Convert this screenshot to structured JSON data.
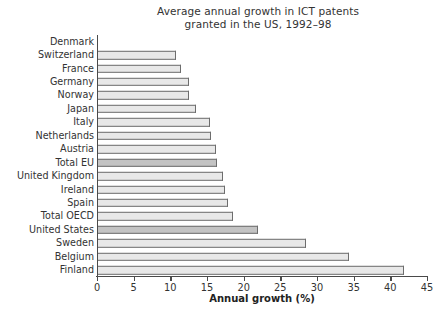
{
  "chart_data": {
    "type": "bar",
    "orientation": "horizontal",
    "title": "Average annual growth in ICT patents granted in the US, 1992–98",
    "title_lines": [
      "Average annual growth in ICT patents",
      "granted in the US, 1992–98"
    ],
    "xlabel": "Annual growth (%)",
    "ylabel": "",
    "xlim": [
      0,
      45
    ],
    "xticks": [
      0,
      5,
      10,
      15,
      20,
      25,
      30,
      35,
      40,
      45
    ],
    "xtick_labels": [
      "0",
      "5",
      "10",
      "15",
      "20",
      "25",
      "30",
      "35",
      "40",
      "45"
    ],
    "grid": false,
    "legend": null,
    "bar_fill_color": "#e8e8e8",
    "bar_accent_color": "#c3c3c3",
    "bar_edge_color": "#6d6d6d",
    "axis_color": "#4a4a4a",
    "categories": [
      "Denmark",
      "Switzerland",
      "France",
      "Germany",
      "Norway",
      "Japan",
      "Italy",
      "Netherlands",
      "Austria",
      "Total EU",
      "United Kingdom",
      "Ireland",
      "Spain",
      "Total OECD",
      "United States",
      "Sweden",
      "Belgium",
      "Finland"
    ],
    "values": [
      0.0,
      10.6,
      11.3,
      12.4,
      12.4,
      13.4,
      15.3,
      15.4,
      16.1,
      16.2,
      17.0,
      17.3,
      17.7,
      18.4,
      21.8,
      28.4,
      34.2,
      41.7
    ],
    "highlighted": [
      "Total EU",
      "United States"
    ]
  }
}
